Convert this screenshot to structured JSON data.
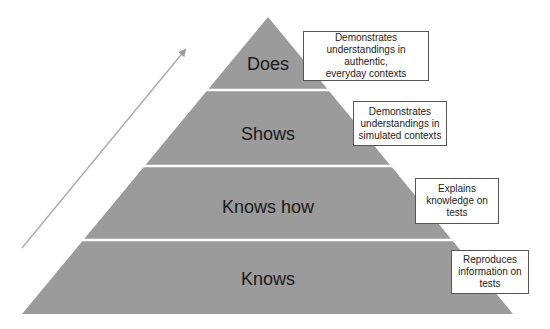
{
  "diagram": {
    "type": "pyramid",
    "colors": {
      "pyramid_fill": "#9b9b9b",
      "divider": "#ffffff",
      "arrow": "#9a9a9a",
      "box_border": "#555555",
      "label_text": "#1a1a1a"
    },
    "arrow": {
      "direction": "up-right",
      "meaning": "increasing level"
    },
    "levels": [
      {
        "label": "Does",
        "description": "Demonstrates\nunderstandings in authentic,\neveryday contexts"
      },
      {
        "label": "Shows",
        "description": "Demonstrates\nunderstandings in\nsimulated contexts"
      },
      {
        "label": "Knows how",
        "description": "Explains\nknowledge on\ntests"
      },
      {
        "label": "Knows",
        "description": "Reproduces\ninformation on\ntests"
      }
    ]
  }
}
